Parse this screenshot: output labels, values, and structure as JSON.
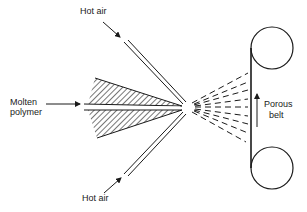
{
  "diagram": {
    "type": "melt-blowing process schematic",
    "labels": {
      "hot_air_top": "Hot air",
      "hot_air_bottom": "Hot air",
      "molten_line1": "Molten",
      "molten_line2": "polymer",
      "belt_line1": "Porous",
      "belt_line2": "belt"
    },
    "colors": {
      "ink": "#1a1a1a",
      "background": "#ffffff"
    }
  }
}
